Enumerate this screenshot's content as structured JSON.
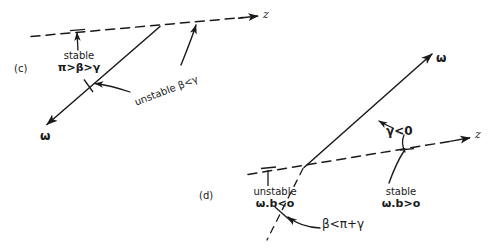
{
  "figure": {
    "background_color": "#ffffff",
    "ink_color": "#1a1a1a",
    "panels": [
      {
        "id": "c",
        "label": "(c)",
        "axis_label": "z",
        "vector_label": "ω",
        "annotations": [
          {
            "name": "stable-note",
            "line1": "stable",
            "line2": "π>β>γ"
          },
          {
            "name": "unstable-note",
            "text": "unstable β<γ"
          }
        ]
      },
      {
        "id": "d",
        "label": "(d)",
        "axis_label": "z",
        "vector_label": "ω",
        "annotations": [
          {
            "name": "gamma-note",
            "text": "γ<0"
          },
          {
            "name": "unstable-note",
            "line1": "unstable",
            "line2": "ω.b<o"
          },
          {
            "name": "stable-note",
            "line1": "stable",
            "line2": "ω.b>o"
          },
          {
            "name": "beta-note",
            "text": "β<π+γ"
          }
        ]
      }
    ]
  },
  "panel_c": {
    "label": "(c)",
    "axis_label": "z",
    "omega_label": "ω",
    "stable_line1": "stable",
    "stable_line2": "π>β>γ",
    "unstable_text": "unstable β<γ"
  },
  "panel_d": {
    "label": "(d)",
    "axis_label": "z",
    "omega_label": "ω",
    "gamma_text": "γ<0",
    "unstable_line1": "unstable",
    "unstable_line2": "ω.b<o",
    "stable_line1": "stable",
    "stable_line2": "ω.b>o",
    "beta_text": "β<π+γ"
  }
}
